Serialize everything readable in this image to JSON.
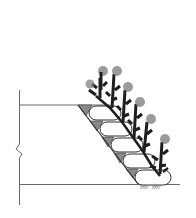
{
  "diagram": {
    "title": "",
    "colors": {
      "line": "#3a3a3a",
      "wedge_fill": "#8a8a8a",
      "bag_fill": "#ffffff",
      "plant": "#1e1e1e",
      "plant_crown": "#7a7a7a",
      "background": "#ffffff"
    },
    "elements": [
      {
        "name": "ground-line-top",
        "type": "line"
      },
      {
        "name": "ground-line-bottom",
        "type": "line"
      },
      {
        "name": "section-break-line",
        "type": "line with break symbol"
      },
      {
        "name": "slope-face",
        "type": "line"
      },
      {
        "name": "soil-bags",
        "count": 5
      },
      {
        "name": "fill-wedges",
        "count": 5
      },
      {
        "name": "plants",
        "count": 6
      },
      {
        "name": "anchor-stakes",
        "count": 2
      }
    ]
  }
}
